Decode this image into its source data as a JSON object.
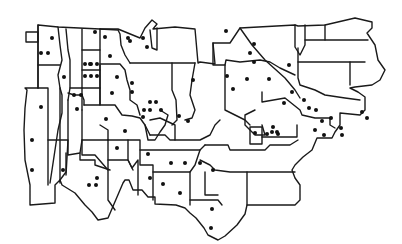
{
  "map": {
    "type": "regional-outline-map",
    "style": "black outline, white fill",
    "colors": {
      "outline": "#1a1a1a",
      "dot": "#111111",
      "background": "#ffffff"
    },
    "dot_radius": 2.0,
    "dots": [
      [
        52,
        38
      ],
      [
        41,
        53
      ],
      [
        48,
        53
      ],
      [
        95,
        32
      ],
      [
        105,
        37
      ],
      [
        90,
        64
      ],
      [
        85,
        64
      ],
      [
        91,
        64
      ],
      [
        97,
        64
      ],
      [
        85,
        76
      ],
      [
        91,
        76
      ],
      [
        97,
        76
      ],
      [
        64,
        77
      ],
      [
        74,
        95
      ],
      [
        81,
        95
      ],
      [
        77,
        109
      ],
      [
        41,
        107
      ],
      [
        32,
        140
      ],
      [
        32,
        170
      ],
      [
        63,
        170
      ],
      [
        128,
        38
      ],
      [
        143,
        38
      ],
      [
        130,
        41
      ],
      [
        147,
        47
      ],
      [
        110,
        56
      ],
      [
        117,
        77
      ],
      [
        132,
        83
      ],
      [
        132,
        92
      ],
      [
        112,
        93
      ],
      [
        150,
        102
      ],
      [
        156,
        102
      ],
      [
        144,
        110
      ],
      [
        150,
        110
      ],
      [
        161,
        110
      ],
      [
        106,
        119
      ],
      [
        125,
        131
      ],
      [
        143,
        117
      ],
      [
        179,
        116
      ],
      [
        193,
        80
      ],
      [
        188,
        121
      ],
      [
        97,
        178
      ],
      [
        89,
        185
      ],
      [
        96,
        185
      ],
      [
        117,
        148
      ],
      [
        148,
        154
      ],
      [
        171,
        163
      ],
      [
        185,
        163
      ],
      [
        200,
        163
      ],
      [
        150,
        178
      ],
      [
        163,
        184
      ],
      [
        180,
        193
      ],
      [
        211,
        228
      ],
      [
        226,
        31
      ],
      [
        254,
        44
      ],
      [
        250,
        53
      ],
      [
        254,
        62
      ],
      [
        289,
        65
      ],
      [
        227,
        76
      ],
      [
        233,
        89
      ],
      [
        247,
        79
      ],
      [
        269,
        79
      ],
      [
        292,
        92
      ],
      [
        309,
        108
      ],
      [
        316,
        110
      ],
      [
        315,
        130
      ],
      [
        341,
        128
      ],
      [
        342,
        135
      ],
      [
        362,
        112
      ],
      [
        367,
        118
      ],
      [
        284,
        103
      ],
      [
        304,
        100
      ],
      [
        331,
        118
      ],
      [
        322,
        121
      ],
      [
        324,
        135
      ],
      [
        273,
        127
      ],
      [
        267,
        134
      ],
      [
        278,
        134
      ],
      [
        255,
        133
      ],
      [
        272,
        132
      ],
      [
        277,
        132
      ],
      [
        213,
        170
      ],
      [
        212,
        209
      ]
    ]
  }
}
